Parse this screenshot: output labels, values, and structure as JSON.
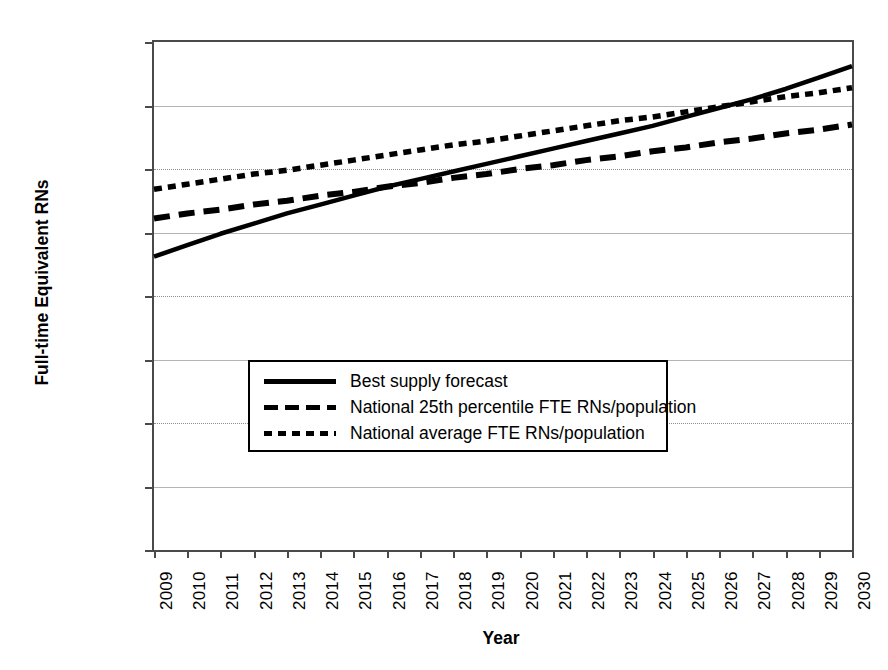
{
  "chart_data": {
    "type": "line",
    "title": "",
    "xlabel": "Year",
    "ylabel": "Full-time Equivalent RNs",
    "grid": true,
    "legend_position": "center",
    "xlim": [
      2009,
      2030
    ],
    "ylim": [
      0,
      400000
    ],
    "ytick_labels": [
      "400,000",
      "350,000",
      "300,000",
      "250,000",
      "200,000",
      "150,000",
      "100,000",
      "50,000",
      "0"
    ],
    "ytick_values": [
      400000,
      350000,
      300000,
      250000,
      200000,
      150000,
      100000,
      50000,
      0
    ],
    "categories": [
      "2009",
      "2010",
      "2011",
      "2012",
      "2013",
      "2014",
      "2015",
      "2016",
      "2017",
      "2018",
      "2019",
      "2020",
      "2021",
      "2022",
      "2023",
      "2024",
      "2025",
      "2026",
      "2027",
      "2028",
      "2029",
      "2030"
    ],
    "x": [
      2009,
      2010,
      2011,
      2012,
      2013,
      2014,
      2015,
      2016,
      2017,
      2018,
      2019,
      2020,
      2021,
      2022,
      2023,
      2024,
      2025,
      2026,
      2027,
      2028,
      2029,
      2030
    ],
    "series": [
      {
        "name": "Best supply forecast",
        "style": "solid",
        "color": "#000000",
        "values": [
          231000,
          240000,
          249000,
          257000,
          265000,
          272000,
          279000,
          286000,
          292000,
          298000,
          304000,
          310000,
          316000,
          322000,
          328000,
          334000,
          341000,
          348000,
          355000,
          363000,
          372000,
          381000
        ]
      },
      {
        "name": "National 25th percentile FTE RNs/population",
        "style": "dashed",
        "color": "#000000",
        "values": [
          261000,
          265000,
          268000,
          272000,
          275000,
          279000,
          282000,
          286000,
          289000,
          293000,
          296000,
          300000,
          303000,
          307000,
          310000,
          314000,
          317000,
          321000,
          324000,
          328000,
          331000,
          335000
        ]
      },
      {
        "name": "National average FTE RNs/population",
        "style": "dotted",
        "color": "#000000",
        "values": [
          284000,
          288000,
          292000,
          296000,
          299000,
          303000,
          307000,
          311000,
          315000,
          319000,
          322000,
          326000,
          330000,
          334000,
          338000,
          341000,
          345000,
          349000,
          353000,
          357000,
          360000,
          364000
        ]
      }
    ],
    "legend_entries": [
      "Best supply forecast",
      "National 25th percentile FTE RNs/population",
      "National average FTE RNs/population"
    ]
  }
}
